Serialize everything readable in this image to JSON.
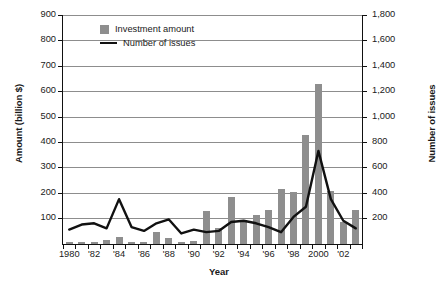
{
  "chart_data": {
    "type": "bar",
    "title": "",
    "xlabel": "Year",
    "ylabel": "Amount (billion $)",
    "ylabel_right": "Number of issues",
    "grid": true,
    "legend_position": "top-left",
    "categories": [
      "1980",
      "1981",
      "1982",
      "1983",
      "1984",
      "1985",
      "1986",
      "1987",
      "1988",
      "1989",
      "1990",
      "1991",
      "1992",
      "1993",
      "1994",
      "1995",
      "1996",
      "1997",
      "1998",
      "1999",
      "2000",
      "2001",
      "2002",
      "2003"
    ],
    "x_tick_labels": [
      "1980",
      "'82",
      "'84",
      "'86",
      "'88",
      "'90",
      "'92",
      "'94",
      "'96",
      "'98",
      "2000",
      "'02"
    ],
    "ylim": [
      0,
      900
    ],
    "y_ticks": [
      "100",
      "200",
      "300",
      "400",
      "500",
      "600",
      "700",
      "800",
      "900"
    ],
    "ylim_right": [
      0,
      1800
    ],
    "y_ticks_right": [
      "200",
      "400",
      "600",
      "800",
      "1,000",
      "1,200",
      "1,400",
      "1,600",
      "1,800"
    ],
    "series": [
      {
        "name": "Investment amount",
        "type": "bar",
        "axis": "left",
        "unit": "billion $",
        "color": "#8e8e8e",
        "values": [
          4,
          4,
          5,
          16,
          26,
          5,
          5,
          48,
          22,
          6,
          12,
          130,
          65,
          185,
          95,
          115,
          135,
          215,
          205,
          430,
          630,
          210,
          85,
          135
        ]
      },
      {
        "name": "Number of issues",
        "type": "line",
        "axis": "right",
        "unit": "issues",
        "color": "#111111",
        "values": [
          110,
          150,
          160,
          120,
          350,
          130,
          100,
          160,
          190,
          80,
          110,
          90,
          100,
          170,
          180,
          160,
          130,
          90,
          210,
          290,
          730,
          350,
          180,
          120
        ]
      }
    ],
    "line_points_right_axis": [
      110,
      150,
      160,
      120,
      350,
      130,
      100,
      160,
      190,
      80,
      110,
      90,
      100,
      170,
      180,
      160,
      130,
      90,
      210,
      290,
      730,
      350,
      180,
      120
    ],
    "annotations": []
  },
  "legend": {
    "items": [
      {
        "label": "Investment amount",
        "marker": "square-swatch"
      },
      {
        "label": "Number of issues",
        "marker": "line-swatch"
      }
    ]
  },
  "axes": {
    "x_title": "Year",
    "y_left_title": "Amount (billion $)",
    "y_right_title": "Number of issues"
  },
  "caption": ""
}
